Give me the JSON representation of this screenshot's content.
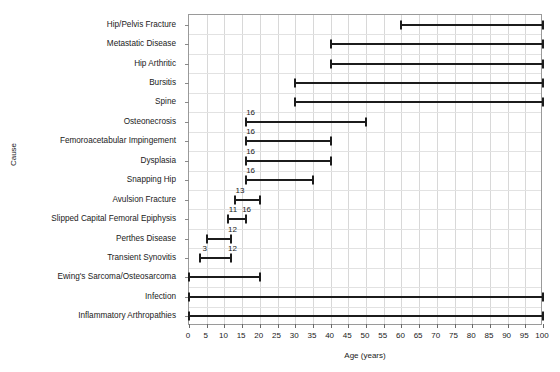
{
  "chart_data": {
    "type": "bar",
    "title": "",
    "subtitle": "",
    "xlabel": "Age (years)",
    "ylabel": "Cause",
    "xlim": [
      0,
      100
    ],
    "xticks": [
      0,
      5,
      10,
      15,
      20,
      25,
      30,
      35,
      40,
      45,
      50,
      55,
      60,
      65,
      70,
      75,
      80,
      85,
      90,
      95,
      100
    ],
    "xticklabels": [
      "0",
      "5",
      "10",
      "15",
      "20",
      "25",
      "30",
      "35",
      "40",
      "45",
      "50",
      "55",
      "60",
      "65",
      "70",
      "75",
      "80",
      "85",
      "90",
      "95",
      "100"
    ],
    "grid": true,
    "legend": "none",
    "orientation": "horizontal",
    "note": "Horizontal range (floating) bar chart of age ranges per cause of hip pain",
    "categories": [
      "Hip/Pelvis Fracture",
      "Metastatic Disease",
      "Hip Arthritic",
      "Bursitis",
      "Spine",
      "Osteonecrosis",
      "Femoroacetabular Impingement",
      "Dysplasia",
      "Snapping Hip",
      "Avulsion Fracture",
      "Slipped Capital Femoral Epiphysis",
      "Perthes Disease",
      "Transient Synovitis",
      "Ewing's Sarcoma/Osteosarcoma",
      "Infection",
      "Inflammatory Arthropathies"
    ],
    "bars": [
      {
        "category": "Hip/Pelvis Fracture",
        "start": 60,
        "end": 100,
        "start_label": "",
        "end_label": ""
      },
      {
        "category": "Metastatic Disease",
        "start": 40,
        "end": 100,
        "start_label": "",
        "end_label": ""
      },
      {
        "category": "Hip Arthritic",
        "start": 40,
        "end": 100,
        "start_label": "",
        "end_label": ""
      },
      {
        "category": "Bursitis",
        "start": 30,
        "end": 100,
        "start_label": "",
        "end_label": ""
      },
      {
        "category": "Spine",
        "start": 30,
        "end": 100,
        "start_label": "",
        "end_label": ""
      },
      {
        "category": "Osteonecrosis",
        "start": 16,
        "end": 50,
        "start_label": "16",
        "end_label": ""
      },
      {
        "category": "Femoroacetabular Impingement",
        "start": 16,
        "end": 40,
        "start_label": "16",
        "end_label": ""
      },
      {
        "category": "Dysplasia",
        "start": 16,
        "end": 40,
        "start_label": "16",
        "end_label": ""
      },
      {
        "category": "Snapping Hip",
        "start": 16,
        "end": 35,
        "start_label": "16",
        "end_label": ""
      },
      {
        "category": "Avulsion Fracture",
        "start": 13,
        "end": 20,
        "start_label": "13",
        "end_label": ""
      },
      {
        "category": "Slipped Capital Femoral Epiphysis",
        "start": 11,
        "end": 16,
        "start_label": "11",
        "end_label": "16"
      },
      {
        "category": "Perthes Disease",
        "start": 5,
        "end": 12,
        "start_label": "",
        "end_label": "12"
      },
      {
        "category": "Transient Synovitis",
        "start": 3,
        "end": 12,
        "start_label": "3",
        "end_label": "12"
      },
      {
        "category": "Ewing's Sarcoma/Osteosarcoma",
        "start": 0,
        "end": 20,
        "start_label": "",
        "end_label": ""
      },
      {
        "category": "Infection",
        "start": 0,
        "end": 100,
        "start_label": "",
        "end_label": ""
      },
      {
        "category": "Inflammatory Arthropathies",
        "start": 0,
        "end": 100,
        "start_label": "",
        "end_label": ""
      }
    ],
    "colors": {
      "bar": "#1c1c1c",
      "grid": "#d8d8d8",
      "axis": "#9a9a9a",
      "text": "#1a1a1a",
      "background": "#ffffff"
    }
  }
}
